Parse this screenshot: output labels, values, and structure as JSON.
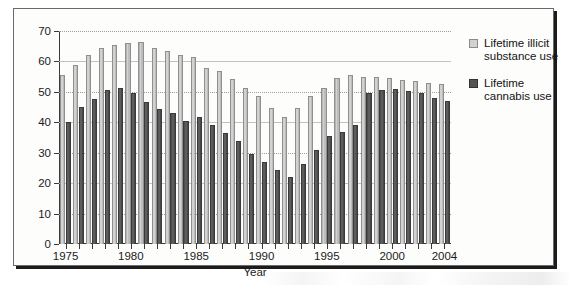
{
  "chart_data": {
    "type": "bar",
    "title": "",
    "xlabel": "Year",
    "ylabel": "",
    "ylim": [
      0,
      70
    ],
    "ytick_step": 10,
    "yticks": [
      0,
      10,
      20,
      30,
      40,
      50,
      60,
      70
    ],
    "grid": "horizontal-dotted",
    "legend_position": "right",
    "categories": [
      1975,
      1976,
      1977,
      1978,
      1979,
      1980,
      1981,
      1982,
      1983,
      1984,
      1985,
      1986,
      1987,
      1988,
      1989,
      1990,
      1991,
      1992,
      1993,
      1994,
      1995,
      1996,
      1997,
      1998,
      1999,
      2000,
      2001,
      2002,
      2003,
      2004
    ],
    "xtick_labels": [
      "1975",
      "1980",
      "1985",
      "1990",
      "1995",
      "2000",
      "2004"
    ],
    "series": [
      {
        "name": "Lifetime illicit substance use",
        "color": "#d2d2d2",
        "values": [
          55.5,
          58.8,
          62.0,
          64.5,
          65.4,
          65.9,
          66.3,
          64.5,
          63.3,
          62.2,
          61.3,
          57.8,
          57.0,
          54.3,
          51.3,
          48.5,
          44.8,
          41.8,
          44.7,
          48.8,
          51.3,
          54.5,
          55.6,
          55.0,
          55.0,
          54.5,
          54.0,
          53.5,
          53.0,
          52.5
        ],
        "values_unit": "percent"
      },
      {
        "name": "Lifetime cannabis use",
        "color": "#555555",
        "values": [
          40.1,
          45.0,
          47.8,
          50.7,
          51.2,
          49.5,
          46.8,
          44.5,
          42.9,
          40.5,
          41.6,
          39.2,
          36.6,
          33.7,
          29.7,
          27.0,
          24.2,
          22.1,
          26.2,
          31.0,
          35.5,
          36.7,
          39.0,
          49.5,
          50.5,
          50.8,
          50.2,
          49.5,
          48.0,
          47.0
        ],
        "values_unit": "percent"
      }
    ]
  },
  "legend": {
    "entries": [
      {
        "label": "Lifetime illicit substance use",
        "icon": "legend-swatch-light"
      },
      {
        "label": "Lifetime cannabis use",
        "icon": "legend-swatch-dark"
      }
    ]
  },
  "axes": {
    "x_title": "Year"
  }
}
